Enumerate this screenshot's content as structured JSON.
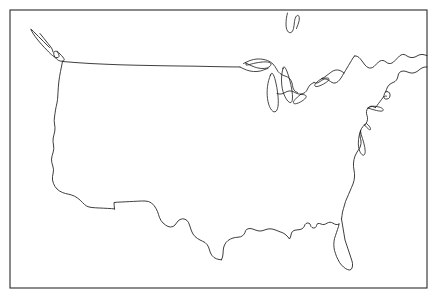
{
  "document": {
    "kind": "blank-outline-map",
    "title": "United States Outline Map",
    "subject": "Contiguous United States",
    "style": "black line art on white background",
    "labels_shown": "none",
    "width_px": 438,
    "height_px": 302
  },
  "colors": {
    "background": "#ffffff",
    "outline": "#1c1c1c",
    "frame": "#2b2b2b"
  },
  "frame": {
    "name": "map-border",
    "x": 10,
    "y": 10,
    "width": 417,
    "height": 278
  },
  "features": [
    {
      "id": "national-outline",
      "name": "contiguous-us-outline",
      "kind": "coastline-and-borders"
    },
    {
      "id": "great-lakes",
      "name": "great-lakes",
      "kind": "lakes"
    },
    {
      "id": "canada-northeast",
      "name": "canada-northeast-coast",
      "kind": "neighbor-coastline"
    },
    {
      "id": "lake-of-the-woods",
      "name": "lake-of-the-woods",
      "kind": "lake"
    },
    {
      "id": "long-island",
      "name": "long-island",
      "kind": "island"
    },
    {
      "id": "cape-cod",
      "name": "cape-cod",
      "kind": "island-chain"
    },
    {
      "id": "chesapeake-bay",
      "name": "chesapeake-bay",
      "kind": "bay"
    },
    {
      "id": "puget-sound",
      "name": "puget-sound-olympic-peninsula",
      "kind": "sound"
    }
  ],
  "geometry": {
    "national_outline": "M 31.5 29.5 C 33.8 33.5 36.5 37.5 39.5 40.8 C 42.5 44.2 45.5 47.5 48.2 50.2 C 50.0 52.0 51.8 53.5 53.2 54.0 C 54.5 54.5 55.2 54.0 55.0 52.8 C 54.6 50.5 52.8 47.2 50.5 44.0 C 48.0 40.5 45.0 37.0 42.5 34.5 C 40.5 32.5 38.8 31.0 37.8 30.2 L 36.5 29.2 L 31.5 29.5 Z",
    "main_border": "M 30.8 29.2 C 32.0 32.0 34.2 35.5 37.0 39.0 C 40.2 43.0 43.8 47.0 47.0 50.2 C 49.5 52.8 51.2 54.5 52.5 55.5 C 53.5 56.3 54.5 57.0 55.5 57.4 C 56.6 57.8 57.5 57.8 58.2 57.4 C 58.9 57.0 59.2 56.2 59.0 55.2 C 58.8 54.2 58.2 53.2 57.5 52.4 C 56.8 51.6 56.0 51.2 55.4 51.2 C 54.6 51.2 54.0 51.8 53.8 52.8 C 53.6 53.8 53.8 55.0 54.4 56.2 C 55.0 57.4 55.8 58.4 56.6 59.0 L 57.4 59.6 L 58.6 60.5 L 60.2 61.0 L 62.0 61.2 L 63.2 61.0 L 64.0 60.4 L 64.2 59.5 L 63.8 58.4 L 62.8 57.0 L 61.5 55.5 L 60.0 54.0 L 58.5 52.5 L 57.2 51.0",
    "west_coast": "M 62.5 61.5 C 62.0 64.5 61.2 68.0 60.5 71.5 C 59.8 75.0 59.2 78.5 58.8 82.0 C 58.4 85.5 58.2 89.0 58.0 92.5 L 57.8 96.0 L 57.5 99.5 L 57.0 103.0 L 56.2 106.5 L 55.5 110.0 L 55.0 113.5 L 54.5 117.0 L 54.2 120.5 L 54.5 124.0 L 55.0 127.5 L 54.8 131.0 L 54.0 134.5 L 53.2 138.0 L 53.0 141.5 L 53.5 145.0 L 53.8 148.5 L 53.2 152.0 L 52.2 155.5 L 51.5 159.0 L 51.8 162.5 L 52.8 166.0 L 53.5 169.5 L 53.2 173.0 L 52.5 176.5 L 52.5 180.0 L 53.5 183.5 L 55.0 186.5 L 57.0 189.0 L 59.5 191.0 L 62.5 192.5 L 65.5 193.5 L 68.5 194.2 L 71.5 195.0 L 74.5 196.2 L 77.5 198.0 L 80.2 200.2 L 82.5 202.5 L 84.5 204.5 L 86.5 206.0 L 89.0 207.0 L 92.0 207.5 L 95.5 207.8 L 99.5 208.0 L 103.5 208.2 L 107.5 208.4 L 111.5 208.6 L 114.5 209.0",
    "mexico_border": "M 114.5 209.0 L 114.2 205.5 L 114.0 202.5 L 117.5 202.2 L 121.5 202.0 L 125.5 201.8 L 129.5 201.6 L 133.5 201.4 L 137.5 201.2 L 141.5 201.0 L 145.0 201.0 L 148.5 201.5 L 151.5 203.0 L 154.0 205.5 L 156.0 208.5 L 157.5 211.5 L 158.5 214.5 L 159.5 217.5 L 161.0 220.5 L 163.0 223.0 L 165.5 225.0 L 168.0 226.5 L 170.5 227.0 L 173.0 226.5 L 175.0 225.0 L 176.5 223.0 L 178.0 221.0 L 180.0 219.5 L 182.5 218.8 L 185.0 219.2 L 187.0 220.5 L 188.5 222.5 L 189.5 225.0 L 190.5 228.0 L 191.5 231.0 L 193.0 234.0 L 195.0 236.5 L 197.5 238.5 L 200.0 240.0 L 202.5 241.2 L 205.0 242.5 L 207.0 244.5 L 208.5 247.0 L 209.5 250.0 L 210.5 253.0 L 212.0 255.5 L 214.0 257.5 L 216.5 258.8 L 219.0 259.5 L 221.5 259.8",
    "gulf_coast": "M 221.5 259.8 L 222.5 257.0 L 223.0 254.0 L 223.2 251.0 L 223.5 248.0 L 224.5 245.0 L 226.0 242.5 L 228.0 240.5 L 230.5 239.0 L 233.0 238.0 L 235.5 237.5 L 238.0 237.2 L 240.5 236.8 L 242.5 235.8 L 244.0 234.2 L 245.0 232.5 L 245.5 230.8 L 246.5 229.5 L 248.0 228.8 L 250.0 228.5 L 252.0 228.8 L 254.0 229.5 L 256.0 230.2 L 258.0 230.8 L 260.0 231.0 L 262.0 230.8 L 264.0 230.2 L 266.0 229.5 L 268.0 229.0 L 270.0 228.8 L 272.0 229.0 L 274.0 229.5 L 276.0 230.2 L 278.0 231.0 L 280.0 231.8 L 282.0 232.5 L 284.0 233.5 L 286.0 235.0 L 288.0 237.0 L 289.5 239.0 L 290.5 237.0 L 291.0 235.0 L 291.5 233.0 L 292.5 231.5 L 294.0 230.5 L 296.0 230.0 L 298.0 229.8 L 300.0 229.5 L 302.0 228.8 L 303.5 227.5 L 304.5 226.0 L 305.0 224.5 L 306.0 223.5 L 307.5 223.0 L 309.0 223.2 L 310.0 224.0 L 310.5 225.2 L 311.0 226.5 L 312.0 227.5 L 313.5 228.0 L 315.0 227.8 L 316.0 226.8 L 316.5 225.5 L 317.0 224.2 L 318.0 223.5 L 319.5 223.5 L 321.0 224.0 L 322.5 224.5 L 324.0 224.5 L 325.5 224.0 L 327.0 223.2 L 328.5 222.5 L 330.0 222.2 L 331.5 222.5 L 333.0 223.2 L 334.5 224.0 L 336.0 224.5 L 337.5 224.5 L 339.0 224.0",
    "florida": "M 339.0 224.0 L 338.5 226.5 L 337.5 229.5 L 336.5 232.5 L 335.5 235.5 L 334.5 238.5 L 334.0 241.5 L 333.8 244.5 L 334.0 247.5 L 334.5 250.5 L 335.5 253.5 L 336.5 256.5 L 338.0 259.5 L 339.5 262.5 L 341.5 265.0 L 343.5 267.0 L 345.5 268.5 L 347.5 269.5 L 349.5 270.0 L 351.0 269.5 L 352.0 268.0 L 352.5 266.0 L 352.5 263.5 L 352.0 261.0 L 351.0 258.0 L 350.0 255.0 L 349.0 252.0 L 348.0 249.0 L 347.0 246.0 L 346.0 243.0 L 345.0 240.0 L 344.5 237.0 L 344.0 234.0 L 343.5 231.0 L 343.0 228.0 L 342.5 225.0 L 342.0 222.0 L 341.5 219.0",
    "atlantic_coast": "M 341.5 219.0 L 342.0 215.5 L 342.5 212.0 L 343.5 208.5 L 344.5 205.0 L 345.5 201.5 L 347.0 198.0 L 348.5 194.5 L 350.0 191.0 L 351.5 187.5 L 353.0 184.0 L 354.0 180.5 L 354.5 177.0 L 354.5 173.5 L 354.0 170.0 L 353.5 166.5 L 353.5 163.0 L 354.0 159.5 L 355.0 156.0 L 356.5 153.0 L 358.0 150.5 L 359.5 148.5 L 360.5 146.0 L 361.0 143.5 L 361.0 141.0 L 360.5 138.5 L 360.0 136.0 L 360.0 133.5 L 360.5 131.0 L 361.5 128.5 L 363.0 126.5 L 364.5 125.0 L 366.0 123.5 L 367.0 121.5 L 367.5 119.5 L 367.5 117.5 L 367.0 115.5 L 366.5 113.5 L 366.5 111.5 L 367.0 109.5 L 368.0 108.0 L 369.5 107.0 L 371.0 106.5 L 372.5 106.5 L 374.0 107.0 L 375.5 107.5",
    "chesapeake": "M 360.5 131.0 C 359.5 133.5 358.8 136.5 358.5 139.5 C 358.2 142.5 358.3 145.5 358.8 148.0 C 359.3 150.5 360.2 152.5 361.2 153.8 C 362.2 155.1 363.2 155.5 364.0 155.0 C 364.8 154.5 365.2 153.2 365.2 151.5 C 365.2 149.0 364.6 146.0 363.8 143.0 C 363.0 140.0 362.0 137.0 361.2 134.5 L 360.5 131.0 Z",
    "delaware_bay": "M 364.5 125.0 C 365.8 126.5 367.2 128.0 368.5 129.0 C 369.5 129.8 370.2 130.0 370.5 129.5 C 370.8 129.0 370.5 128.0 369.8 127.0 C 369.0 125.8 367.8 124.5 366.5 123.5 L 364.5 125.0 Z",
    "long_island": "M 368.0 108.0 C 370.5 108.8 373.5 109.8 376.5 110.5 C 379.0 111.1 381.0 111.3 382.2 111.0 C 383.2 110.7 383.5 110.0 383.0 109.2 C 382.4 108.3 381.0 107.5 379.0 107.0 C 376.5 106.3 373.5 106.0 370.8 106.2 L 368.0 108.0 Z",
    "new_england_coast": "M 375.5 107.5 L 377.0 105.5 L 378.5 103.5 L 380.0 101.5 L 381.5 99.5 L 383.0 97.5 L 384.0 95.5 L 384.5 93.5 L 385.5 92.0 L 387.0 91.5 L 388.5 92.0 L 389.5 93.0 L 390.0 94.5 L 390.0 96.0 L 389.5 97.5 L 388.5 98.5 L 387.0 99.0 L 385.5 99.0 L 384.5 98.5 L 384.0 97.5 L 384.5 96.5 L 385.5 96.0 L 386.5 96.2",
    "maine_coast": "M 385.5 92.0 L 386.5 89.5 L 387.5 87.0 L 389.0 85.0 L 391.0 83.5 L 393.0 82.5 L 395.0 81.5 L 396.5 80.0 L 397.5 78.0 L 398.0 76.0 L 398.5 74.0 L 399.5 72.5 L 401.0 71.5 L 403.0 71.0 L 405.0 71.2 L 407.0 71.8 L 409.0 72.5 L 411.0 73.0 L 413.0 73.0 L 415.0 72.5 L 417.0 71.5 L 419.0 70.0 L 421.0 68.5 L 423.0 67.5 L 425.0 67.0 L 427.0 67.0",
    "canada_east": "M 427.0 55.5 L 425.0 55.0 L 423.0 54.5 L 421.0 54.5 L 419.0 55.0 L 417.0 56.0 L 415.0 57.0 L 413.0 57.5 L 411.0 57.5 L 409.0 57.0 L 407.0 56.0 L 405.5 55.0 L 404.0 54.5 L 402.5 54.5 L 401.0 55.0 L 399.5 56.0 L 398.0 57.5 L 396.5 59.0 L 395.0 60.5 L 393.5 62.0 L 392.0 63.0 L 390.5 63.5 L 389.0 63.5 L 387.5 63.0 L 386.0 62.0 L 384.5 61.0 L 383.0 60.5 L 381.5 60.5 L 380.0 61.0 L 378.5 62.0 L 377.0 63.5 L 375.5 65.0 L 374.0 66.5 L 372.5 67.5 L 371.0 68.0 L 369.5 68.0 L 368.0 67.5 L 366.5 66.5 L 365.0 65.0 L 363.5 63.0 L 362.0 61.0 L 360.5 59.0 L 359.0 57.5 L 357.5 56.5 L 356.0 56.0 L 354.5 56.0",
    "st_lawrence": "M 354.5 56.0 L 353.0 58.0 L 351.5 60.5 L 350.0 63.0 L 348.5 65.5 L 347.0 68.0 L 345.5 70.5 L 344.0 73.0 L 342.5 75.5 L 341.0 78.0 L 339.5 80.0 L 338.0 81.5 L 336.5 82.5 L 335.0 83.0 L 333.5 83.0 L 332.0 82.5 L 330.5 81.5 L 329.0 80.5 L 327.5 79.5 L 326.0 79.0 L 324.5 79.0 L 323.0 79.5 L 321.5 80.5 L 320.0 81.5 L 318.5 82.5 L 317.0 83.0 L 315.5 83.0 L 314.0 82.5",
    "canada_border_east": "M 344.0 73.0 L 342.0 71.5 L 340.0 70.5 L 338.0 70.0 L 336.0 70.0 L 334.0 70.5 L 332.0 71.5 L 330.0 73.0 L 328.0 74.5 L 326.0 76.0 L 324.0 77.5 L 322.0 78.5",
    "great_lakes_border": "M 314.0 82.5 L 312.0 83.5 L 310.0 85.0 L 308.5 87.0 L 307.5 89.0 L 306.5 91.0 L 305.0 92.5 L 303.0 93.5 L 301.0 94.0 L 299.0 94.0 L 297.0 93.5 L 295.0 92.5 L 293.0 91.5 L 291.0 91.0 L 289.0 91.0 L 287.0 91.5 L 285.0 92.5 L 283.0 93.5 L 281.0 94.0 L 279.0 94.0 L 277.0 93.5",
    "lake_ontario": "M 322.0 78.5 C 320.0 79.5 318.0 81.0 316.5 82.5 C 315.2 83.8 314.5 85.0 314.8 85.8 C 315.1 86.6 316.4 86.8 318.2 86.3 C 320.5 85.7 323.2 84.3 325.5 82.8 C 327.5 81.5 328.8 80.2 329.0 79.3 C 329.2 78.4 328.3 78.0 326.8 78.0 C 325.3 78.0 323.6 78.2 322.0 78.5 Z",
    "lake_erie": "M 300.5 94.5 C 298.5 96.0 296.5 97.8 295.0 99.5 C 293.8 100.9 293.2 102.2 293.5 103.0 C 293.8 103.8 295.0 104.0 296.8 103.5 C 299.0 102.9 301.5 101.5 303.5 100.0 C 305.2 98.7 306.2 97.4 306.2 96.5 C 306.2 95.6 305.3 95.0 303.8 94.7 C 302.8 94.5 301.6 94.4 300.5 94.5 Z",
    "lake_huron": "M 283.0 68.5 C 282.0 72.0 281.5 76.0 281.5 80.0 C 281.5 84.0 282.0 88.0 283.0 91.5 C 284.0 95.0 285.5 98.0 287.0 100.0 C 288.5 102.0 290.0 103.0 291.0 102.5 C 292.0 102.0 292.5 100.0 292.5 97.0 C 292.5 93.5 291.8 89.0 290.8 84.5 C 289.8 80.0 288.5 75.5 287.2 72.0 C 286.0 68.8 284.8 66.8 284.0 66.8 C 283.4 66.8 283.1 67.4 283.0 68.5 Z",
    "lake_michigan": "M 270.5 75.0 C 269.0 78.5 268.0 82.5 267.5 86.5 C 267.0 90.5 267.0 94.5 267.5 98.5 C 268.0 102.5 269.0 106.0 270.5 108.5 C 272.0 111.0 273.5 112.2 275.0 111.8 C 276.5 111.4 277.5 109.5 278.0 106.5 C 278.5 103.0 278.3 98.5 277.8 94.0 C 277.3 89.5 276.5 85.0 275.5 81.0 C 274.5 77.2 273.5 74.5 272.5 73.5 C 271.8 72.8 271.0 73.3 270.5 75.0 Z",
    "lake_superior": "M 246.0 63.0 C 248.5 64.5 251.5 66.0 254.5 67.0 C 257.5 68.0 260.5 68.5 263.0 68.5 C 265.5 68.5 267.5 68.0 269.0 67.0 C 270.5 66.0 271.2 64.8 271.0 63.8 C 270.8 62.8 269.5 62.2 267.5 62.0 C 265.0 61.7 261.8 62.0 258.5 62.5 C 255.2 63.0 252.0 63.8 249.5 64.5 C 247.8 65.0 246.7 65.3 246.0 65.0 L 246.0 63.0 Z",
    "lakes_outline": "M 243.5 63.5 L 246.5 62.0 L 250.0 60.5 L 253.5 59.5 L 257.0 59.0 L 260.5 59.0 L 264.0 59.5 L 267.5 60.5 L 270.5 62.0 L 273.0 64.0 L 275.0 66.5 L 276.5 69.0 L 278.0 71.5 L 280.0 73.5 L 282.5 75.0 L 285.0 76.0 L 287.5 77.0 L 289.5 78.5 L 291.0 80.5 L 292.0 83.0 L 292.5 85.5 L 293.0 88.0 L 294.0 90.0 L 295.5 91.5 L 297.5 92.5",
    "michigan_up": "M 240.0 67.0 L 243.0 68.5 L 246.5 70.0 L 250.0 71.0 L 253.5 71.5 L 257.0 71.5 L 260.5 71.0 L 263.5 70.0 L 266.0 69.0 L 268.0 68.5",
    "northern_border": "M 62.5 61.5 L 75.0 62.5 L 90.0 63.5 L 105.0 64.2 L 120.0 64.8 L 135.0 65.2 L 150.0 65.5 L 165.0 65.8 L 180.0 66.0 L 195.0 66.2 L 210.0 66.5 L 225.0 66.8 L 240.0 67.0",
    "lake_of_the_woods": "M 287.5 13.0 C 286.5 16.5 286.0 20.5 286.0 24.0 C 286.0 27.0 286.5 29.5 287.5 31.0 C 288.5 32.5 289.8 33.0 291.0 32.5 C 292.2 32.0 293.0 30.5 293.5 28.5 C 294.0 26.5 294.2 24.0 294.5 21.5 C 294.8 19.0 295.5 17.0 296.5 16.0 C 297.5 15.0 298.5 15.2 299.0 16.5 C 299.5 17.8 299.3 20.0 298.8 22.0 C 298.3 24.0 297.5 25.8 297.0 27.0 L 296.5 28.5",
    "puget_sound": "M 31.5 29.5 L 33.5 31.5 L 36.0 34.0 L 38.5 36.5 L 41.0 39.0 L 43.5 41.5 L 46.0 44.0 L 48.0 46.0 L 49.5 47.5",
    "cascadia_inner": "M 40.0 33.5 L 42.0 36.0 L 44.0 38.5 L 46.0 41.0 L 48.0 43.5 L 50.0 46.0 L 51.5 48.0 L 52.5 50.0 L 53.0 52.0"
  }
}
